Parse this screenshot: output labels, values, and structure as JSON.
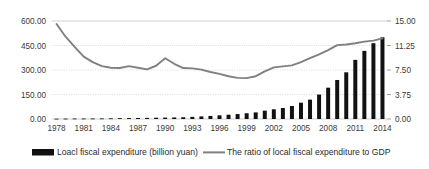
{
  "chart_data": {
    "type": "bar",
    "title": "",
    "xlabel": "",
    "ylabel": "",
    "grid": true,
    "legend_position": "bottom",
    "x": [
      1978,
      1979,
      1980,
      1981,
      1982,
      1983,
      1984,
      1985,
      1986,
      1987,
      1988,
      1989,
      1990,
      1991,
      1992,
      1993,
      1994,
      1995,
      1996,
      1997,
      1998,
      1999,
      2000,
      2001,
      2002,
      2003,
      2004,
      2005,
      2006,
      2007,
      2008,
      2009,
      2010,
      2011,
      2012,
      2013,
      2014
    ],
    "xtick_labels": [
      "1978",
      "1981",
      "1984",
      "1987",
      "1990",
      "1993",
      "1996",
      "1999",
      "2002",
      "2005",
      "2008",
      "2011",
      "2014"
    ],
    "left_axis": {
      "label": "",
      "ticks": [
        "0.00",
        "150.00",
        "300.00",
        "450.00",
        "600.00"
      ],
      "tick_values": [
        0,
        150,
        300,
        450,
        600
      ],
      "ylim": [
        0,
        600
      ]
    },
    "right_axis": {
      "label": "",
      "ticks": [
        "0.00",
        "3.75",
        "7.50",
        "11.25",
        "15.00"
      ],
      "tick_values": [
        0,
        3.75,
        7.5,
        11.25,
        15
      ],
      "ylim": [
        0,
        15
      ]
    },
    "series": [
      {
        "name": "Loacl fiscal expenditure (billion yuan)",
        "type": "bar",
        "axis": "left",
        "color": "#111111",
        "values": [
          5.2,
          6.4,
          7.7,
          7.5,
          8.0,
          8.9,
          10.7,
          12.9,
          14.6,
          15.9,
          18.0,
          20.2,
          21.9,
          24.3,
          27.5,
          33.3,
          40.4,
          48.3,
          57.9,
          67.0,
          77.3,
          90.4,
          103.7,
          131.4,
          152.8,
          172.5,
          204.6,
          256.3,
          304.5,
          384.0,
          492.5,
          613.4,
          734.0,
          929.5,
          1070.7,
          1192.0,
          1285.2
        ],
        "display_values_billion_yuan_scaled": [
          2,
          2.5,
          3,
          3,
          3.2,
          3.5,
          4.2,
          5,
          5.7,
          6.2,
          7,
          7.9,
          8.5,
          9.5,
          10.7,
          13,
          15.8,
          18.8,
          22.6,
          26.1,
          30.1,
          35.2,
          40.4,
          51.2,
          59.5,
          67.2,
          79.7,
          99.8,
          118.6,
          149.6,
          191.8,
          238.9,
          285.9,
          362,
          417,
          464,
          500.5
        ]
      },
      {
        "name": "The ratio of local fiscal expenditure to GDP",
        "type": "line",
        "axis": "right",
        "color": "#808080",
        "values": [
          14.55,
          12.6,
          11.05,
          9.55,
          8.7,
          8.1,
          7.85,
          7.8,
          8.1,
          7.85,
          7.6,
          8.15,
          9.3,
          8.45,
          7.8,
          7.75,
          7.55,
          7.2,
          6.9,
          6.55,
          6.3,
          6.25,
          6.55,
          7.3,
          7.9,
          8.05,
          8.2,
          8.7,
          9.3,
          9.9,
          10.55,
          11.3,
          11.4,
          11.6,
          11.85,
          12.0,
          12.35
        ]
      }
    ]
  },
  "legend": {
    "items": [
      {
        "label": "Loacl fiscal expenditure (billion yuan)",
        "marker": "bar-swatch",
        "color": "#111111"
      },
      {
        "label": "The ratio of local fiscal expenditure to GDP",
        "marker": "line-swatch",
        "color": "#808080"
      }
    ]
  }
}
